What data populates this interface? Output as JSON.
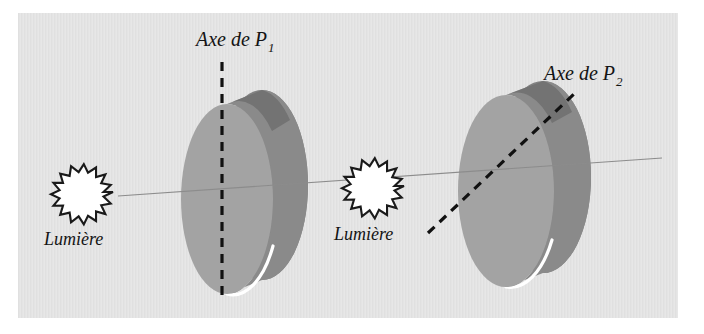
{
  "figure": {
    "title_absent": true,
    "panel": {
      "background_color": "#e3e3e3",
      "x": 18,
      "y": 13,
      "width": 660,
      "height": 305
    },
    "page_background_color": "#ffffff"
  },
  "colors": {
    "disc_face": "#a3a3a3",
    "disc_rim_dark": "#828282",
    "disc_rim_top_dark": "#6f6f6f",
    "disc_highlight": "#ffffff",
    "ray_line": "#8c8c8c",
    "dashed_axis": "#111111",
    "starburst_fill": "#ffffff",
    "starburst_stroke": "#1a1a1a",
    "text": "#141414"
  },
  "labels": {
    "axis_1": {
      "text": "Axe de P",
      "subscript": "1",
      "x": 196,
      "y": 46
    },
    "axis_2": {
      "text": "Axe de P",
      "subscript": "2",
      "x": 544,
      "y": 80
    },
    "light_1": {
      "text": "Lumière",
      "x": 44,
      "y": 245
    },
    "light_2": {
      "text": "Lumière",
      "x": 334,
      "y": 240
    }
  },
  "elements": {
    "light_source_1": {
      "name": "Lumière",
      "cx": 88,
      "cy": 192,
      "r_outer": 25,
      "r_inner": 19,
      "points": 16
    },
    "light_source_2": {
      "name": "Lumière",
      "cx": 379,
      "cy": 186,
      "r_outer": 25,
      "r_inner": 19,
      "points": 16
    },
    "polarizer_1": {
      "name": "P1",
      "cx": 227,
      "cy": 199,
      "rx": 46,
      "ry": 95,
      "depth_x": 35,
      "depth_y": -14
    },
    "polarizer_2": {
      "name": "P2",
      "cx": 506,
      "cy": 191,
      "rx": 48,
      "ry": 96,
      "depth_x": 37,
      "depth_y": -14
    },
    "light_ray": {
      "x1": 118,
      "y1": 196,
      "x2": 662,
      "y2": 158
    },
    "axis_line_1": {
      "x1": 222,
      "y1": 62,
      "x2": 222,
      "y2": 302,
      "orientation": "vertical"
    },
    "axis_line_2": {
      "x1": 428,
      "y1": 233,
      "x2": 574,
      "y2": 94,
      "orientation": "diagonal"
    }
  }
}
